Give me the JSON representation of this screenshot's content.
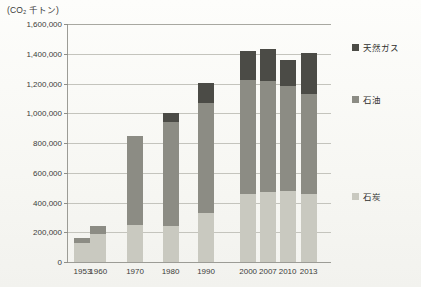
{
  "unit_label": "(CO₂ 千トン)",
  "caption": "",
  "colors": {
    "coal": "#c9c9c0",
    "oil": "#8c8c84",
    "gas": "#4b4b46",
    "axis": "#9c9c96",
    "grid": "#c4c4bd"
  },
  "legend": {
    "position": "right",
    "items": [
      {
        "label": "天然ガス",
        "color": "#4b4b46",
        "top": 0
      },
      {
        "label": "石油",
        "color": "#8c8c84",
        "top": 52
      },
      {
        "label": "石炭",
        "color": "#c9c9c0",
        "top": 149
      }
    ]
  },
  "chart_data": {
    "type": "bar",
    "stacked": true,
    "title": "",
    "subtitle": "",
    "xlabel": "",
    "ylabel": "(CO₂ 千トン)",
    "ylim": [
      0,
      1600000
    ],
    "ytick_step": 200000,
    "grid": true,
    "legend_position": "right",
    "categories": [
      "1953",
      "1960",
      "1970",
      "1980",
      "1990",
      "2000",
      "2007",
      "2010",
      "2013"
    ],
    "category_positions": [
      0.055,
      0.115,
      0.255,
      0.39,
      0.525,
      0.685,
      0.76,
      0.835,
      0.915
    ],
    "ytick_labels": [
      "0",
      "200,000",
      "400,000",
      "600,000",
      "800,000",
      "1,000,000",
      "1,200,000",
      "1,400,000",
      "1,600,000"
    ],
    "series": [
      {
        "name": "石炭",
        "color": "#c9c9c0",
        "values": [
          130000,
          185000,
          250000,
          240000,
          330000,
          460000,
          470000,
          475000,
          460000
        ]
      },
      {
        "name": "石油",
        "color": "#8c8c84",
        "values": [
          30000,
          55000,
          600000,
          700000,
          740000,
          765000,
          750000,
          705000,
          670000
        ]
      },
      {
        "name": "天然ガス",
        "color": "#4b4b46",
        "values": [
          0,
          0,
          0,
          60000,
          135000,
          195000,
          215000,
          180000,
          275000
        ]
      }
    ],
    "totals": [
      160000,
      240000,
      850000,
      1000000,
      1205000,
      1420000,
      1435000,
      1360000,
      1405000
    ]
  }
}
